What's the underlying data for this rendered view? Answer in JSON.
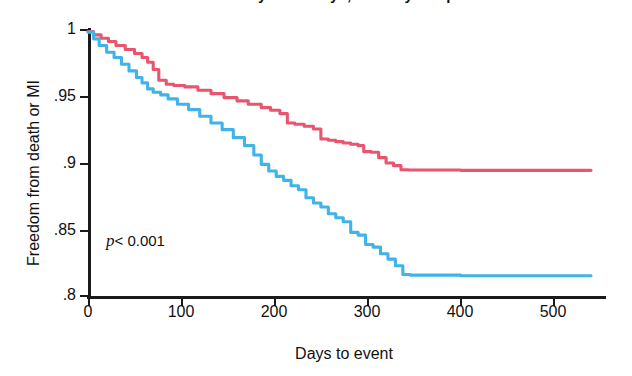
{
  "figure": {
    "title_partial": "Clinical Efficacy at 30 Days, Primary Endpoint",
    "pvalue_symbol": "p",
    "pvalue_text": "< 0.001"
  },
  "colors": {
    "series_red": "#e8556f",
    "series_blue": "#40b4e8",
    "axis": "#1a1a1a",
    "background": "#ffffff"
  },
  "chart_data": {
    "type": "line",
    "title": "Clinical Efficacy at 30 Days, Primary Endpoint",
    "xlabel": "Days to event",
    "ylabel": "Freedom from death or MI",
    "xlim": [
      0,
      555
    ],
    "ylim": [
      0.8,
      1.0
    ],
    "xticks": [
      0,
      100,
      200,
      300,
      400,
      500
    ],
    "xtick_labels": [
      "0",
      "100",
      "200",
      "300",
      "400",
      "500"
    ],
    "yticks": [
      0.8,
      0.85,
      0.9,
      0.95,
      1.0
    ],
    "ytick_labels": [
      ".8",
      ".85",
      ".9",
      ".95",
      "1"
    ],
    "grid": false,
    "legend": "none",
    "annotations": [
      {
        "text": "p< 0.001",
        "x": 20,
        "y": 0.838
      }
    ],
    "series": [
      {
        "name": "upper-curve",
        "color": "#e8556f",
        "style": "kaplan-meier-step",
        "points": [
          [
            0,
            0.9985
          ],
          [
            6,
            0.996
          ],
          [
            14,
            0.9935
          ],
          [
            22,
            0.991
          ],
          [
            30,
            0.988
          ],
          [
            40,
            0.985
          ],
          [
            50,
            0.982
          ],
          [
            58,
            0.979
          ],
          [
            64,
            0.9755
          ],
          [
            70,
            0.97
          ],
          [
            76,
            0.962
          ],
          [
            84,
            0.959
          ],
          [
            92,
            0.958
          ],
          [
            104,
            0.957
          ],
          [
            118,
            0.9545
          ],
          [
            132,
            0.952
          ],
          [
            146,
            0.949
          ],
          [
            160,
            0.9465
          ],
          [
            172,
            0.944
          ],
          [
            186,
            0.9415
          ],
          [
            196,
            0.9395
          ],
          [
            206,
            0.937
          ],
          [
            214,
            0.93
          ],
          [
            222,
            0.929
          ],
          [
            232,
            0.9275
          ],
          [
            242,
            0.9255
          ],
          [
            250,
            0.918
          ],
          [
            258,
            0.917
          ],
          [
            266,
            0.916
          ],
          [
            274,
            0.915
          ],
          [
            282,
            0.914
          ],
          [
            290,
            0.913
          ],
          [
            296,
            0.9085
          ],
          [
            304,
            0.908
          ],
          [
            312,
            0.904
          ],
          [
            320,
            0.9
          ],
          [
            328,
            0.898
          ],
          [
            336,
            0.895
          ],
          [
            344,
            0.8948
          ],
          [
            400,
            0.8945
          ],
          [
            470,
            0.8945
          ],
          [
            540,
            0.8945
          ]
        ]
      },
      {
        "name": "lower-curve",
        "color": "#40b4e8",
        "style": "kaplan-meier-step",
        "points": [
          [
            0,
            0.998
          ],
          [
            6,
            0.993
          ],
          [
            12,
            0.988
          ],
          [
            20,
            0.983
          ],
          [
            28,
            0.979
          ],
          [
            36,
            0.974
          ],
          [
            44,
            0.969
          ],
          [
            52,
            0.964
          ],
          [
            58,
            0.96
          ],
          [
            64,
            0.9555
          ],
          [
            70,
            0.953
          ],
          [
            78,
            0.951
          ],
          [
            86,
            0.948
          ],
          [
            96,
            0.944
          ],
          [
            108,
            0.94
          ],
          [
            120,
            0.935
          ],
          [
            132,
            0.93
          ],
          [
            144,
            0.925
          ],
          [
            156,
            0.919
          ],
          [
            168,
            0.913
          ],
          [
            178,
            0.906
          ],
          [
            186,
            0.899
          ],
          [
            194,
            0.894
          ],
          [
            202,
            0.89
          ],
          [
            210,
            0.887
          ],
          [
            218,
            0.883
          ],
          [
            226,
            0.88
          ],
          [
            234,
            0.874
          ],
          [
            242,
            0.87
          ],
          [
            250,
            0.867
          ],
          [
            258,
            0.862
          ],
          [
            266,
            0.859
          ],
          [
            274,
            0.856
          ],
          [
            282,
            0.848
          ],
          [
            290,
            0.846
          ],
          [
            298,
            0.839
          ],
          [
            306,
            0.837
          ],
          [
            314,
            0.832
          ],
          [
            322,
            0.828
          ],
          [
            330,
            0.823
          ],
          [
            338,
            0.8165
          ],
          [
            346,
            0.816
          ],
          [
            400,
            0.8155
          ],
          [
            470,
            0.8155
          ],
          [
            540,
            0.8155
          ]
        ]
      }
    ]
  }
}
